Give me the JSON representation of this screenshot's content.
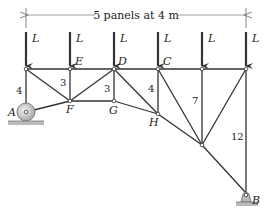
{
  "diagram": {
    "type": "truss",
    "dimension_label": "5 panels at 4 m",
    "load_label": "L",
    "load_count": 6,
    "nodes": {
      "A": "A",
      "B": "B",
      "C": "C",
      "D": "D",
      "E": "E",
      "F": "F",
      "G": "G",
      "H": "H"
    },
    "member_lengths": {
      "left_vertical": "4",
      "E_vertical": "3",
      "D_vertical": "3",
      "C_vertical": "4",
      "panel5_vertical": "7",
      "right_vertical": "12"
    },
    "supports": {
      "A": "roller",
      "B": "pin"
    },
    "colors": {
      "line": "#333333",
      "background": "#ffffff"
    }
  }
}
